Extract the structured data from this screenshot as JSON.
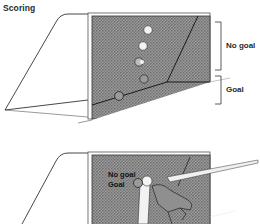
{
  "title": "Scoring",
  "top_diagram": {
    "labels": {
      "no_goal": "No goal",
      "goal": "Goal"
    }
  },
  "bottom_diagram": {
    "labels": {
      "no_goal": "No goal",
      "goal": "Goal"
    }
  },
  "colors": {
    "net_shading": "#8a8a8a",
    "line": "#2a2a2a",
    "background": "#ffffff"
  }
}
